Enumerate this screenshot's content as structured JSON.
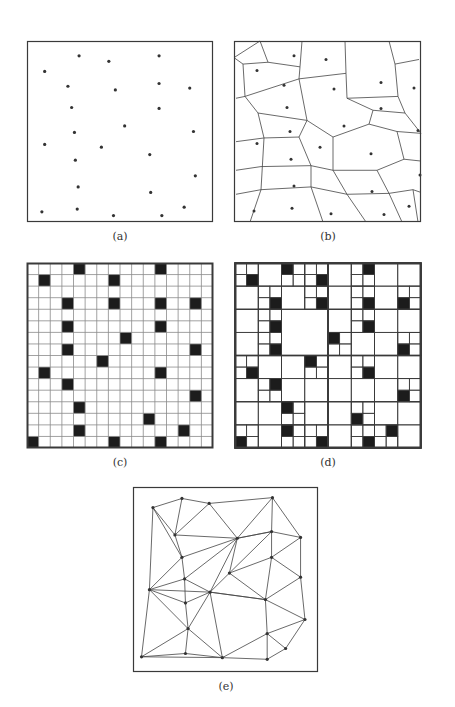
{
  "figure": {
    "colors": {
      "line": "#444444",
      "frame": "#3a3a3a",
      "cell_fill": "#1c1c1c",
      "point": "#333333",
      "grid": "#8a8a8a"
    },
    "panels": [
      {
        "id": "a",
        "caption": "(a)",
        "type": "point-set",
        "frame": [
          27,
          41,
          186,
          181
        ]
      },
      {
        "id": "b",
        "caption": "(b)",
        "type": "voronoi",
        "frame": [
          234,
          41,
          187,
          181
        ]
      },
      {
        "id": "c",
        "caption": "(c)",
        "type": "raster-grid",
        "frame": [
          27,
          263,
          186,
          185
        ],
        "grid_size": 16
      },
      {
        "id": "d",
        "caption": "(d)",
        "type": "quadtree",
        "frame": [
          235,
          263,
          186,
          185
        ],
        "grid_size": 16
      },
      {
        "id": "e",
        "caption": "(e)",
        "type": "delaunay-tin",
        "frame": [
          133,
          487,
          185,
          185
        ]
      }
    ],
    "points_a": [
      [
        56,
        16
      ],
      [
        88,
        22
      ],
      [
        142,
        16
      ],
      [
        19,
        33
      ],
      [
        44,
        49
      ],
      [
        95,
        53
      ],
      [
        142,
        46
      ],
      [
        175,
        51
      ],
      [
        48,
        72
      ],
      [
        142,
        73
      ],
      [
        105,
        92
      ],
      [
        51,
        99
      ],
      [
        179,
        98
      ],
      [
        19,
        112
      ],
      [
        80,
        115
      ],
      [
        52,
        129
      ],
      [
        132,
        123
      ],
      [
        181,
        146
      ],
      [
        55,
        158
      ],
      [
        133,
        164
      ],
      [
        169,
        180
      ],
      [
        16,
        185
      ],
      [
        54,
        182
      ],
      [
        93,
        189
      ],
      [
        145,
        189
      ]
    ],
    "points_b": [
      [
        60,
        16
      ],
      [
        92,
        20
      ],
      [
        147,
        45
      ],
      [
        23,
        32
      ],
      [
        50,
        48
      ],
      [
        100,
        52
      ],
      [
        180,
        51
      ],
      [
        53,
        72
      ],
      [
        147,
        73
      ],
      [
        110,
        92
      ],
      [
        56,
        98
      ],
      [
        184,
        97
      ],
      [
        23,
        111
      ],
      [
        86,
        115
      ],
      [
        57,
        128
      ],
      [
        137,
        122
      ],
      [
        186,
        145
      ],
      [
        60,
        157
      ],
      [
        138,
        163
      ],
      [
        175,
        179
      ],
      [
        20,
        184
      ],
      [
        58,
        181
      ],
      [
        97,
        187
      ],
      [
        150,
        188
      ]
    ],
    "voronoi_edges": [
      [
        0,
        18,
        26,
        0
      ],
      [
        26,
        0,
        34,
        23
      ],
      [
        34,
        23,
        9,
        25
      ],
      [
        9,
        25,
        0,
        18
      ],
      [
        34,
        23,
        66,
        28
      ],
      [
        66,
        28,
        68,
        0
      ],
      [
        66,
        28,
        65,
        41
      ],
      [
        65,
        41,
        11,
        60
      ],
      [
        11,
        60,
        9,
        25
      ],
      [
        11,
        60,
        2,
        62
      ],
      [
        65,
        41,
        112,
        35
      ],
      [
        112,
        35,
        111,
        0
      ],
      [
        112,
        35,
        113,
        62
      ],
      [
        113,
        62,
        164,
        60
      ],
      [
        164,
        60,
        161,
        25
      ],
      [
        161,
        25,
        185,
        20
      ],
      [
        161,
        25,
        155,
        0
      ],
      [
        113,
        62,
        139,
        75
      ],
      [
        139,
        75,
        171,
        78
      ],
      [
        171,
        78,
        164,
        60
      ],
      [
        171,
        78,
        187,
        100
      ],
      [
        139,
        75,
        135,
        90
      ],
      [
        135,
        90,
        99,
        104
      ],
      [
        99,
        104,
        73,
        86
      ],
      [
        73,
        86,
        65,
        41
      ],
      [
        73,
        86,
        24,
        78
      ],
      [
        24,
        78,
        11,
        60
      ],
      [
        24,
        78,
        30,
        105
      ],
      [
        30,
        105,
        2,
        109
      ],
      [
        30,
        105,
        65,
        104
      ],
      [
        65,
        104,
        73,
        86
      ],
      [
        65,
        104,
        77,
        135
      ],
      [
        77,
        135,
        99,
        140
      ],
      [
        99,
        140,
        99,
        104
      ],
      [
        135,
        90,
        163,
        98
      ],
      [
        163,
        98,
        187,
        100
      ],
      [
        163,
        98,
        170,
        128
      ],
      [
        170,
        128,
        187,
        130
      ],
      [
        170,
        128,
        143,
        140
      ],
      [
        143,
        140,
        99,
        140
      ],
      [
        99,
        140,
        113,
        166
      ],
      [
        113,
        166,
        77,
        158
      ],
      [
        77,
        158,
        77,
        135
      ],
      [
        77,
        158,
        27,
        161
      ],
      [
        27,
        161,
        30,
        105
      ],
      [
        27,
        161,
        2,
        166
      ],
      [
        27,
        161,
        16,
        196
      ],
      [
        77,
        158,
        89,
        196
      ],
      [
        113,
        166,
        132,
        196
      ],
      [
        77,
        135,
        27,
        136
      ],
      [
        143,
        140,
        155,
        165
      ],
      [
        155,
        165,
        113,
        166
      ],
      [
        155,
        165,
        168,
        196
      ],
      [
        155,
        165,
        179,
        161
      ],
      [
        179,
        161,
        187,
        164
      ],
      [
        179,
        161,
        184,
        196
      ],
      [
        27,
        136,
        2,
        140
      ]
    ],
    "filled_cells": [
      [
        0,
        4
      ],
      [
        0,
        11
      ],
      [
        1,
        1
      ],
      [
        1,
        7
      ],
      [
        3,
        3
      ],
      [
        3,
        7
      ],
      [
        3,
        11
      ],
      [
        3,
        14
      ],
      [
        5,
        3
      ],
      [
        5,
        11
      ],
      [
        6,
        8
      ],
      [
        7,
        3
      ],
      [
        7,
        14
      ],
      [
        8,
        6
      ],
      [
        9,
        1
      ],
      [
        9,
        11
      ],
      [
        10,
        3
      ],
      [
        11,
        14
      ],
      [
        12,
        4
      ],
      [
        13,
        10
      ],
      [
        14,
        4
      ],
      [
        14,
        13
      ],
      [
        15,
        0
      ],
      [
        15,
        7
      ],
      [
        15,
        11
      ]
    ],
    "tin_nodes": [
      [
        17,
        20
      ],
      [
        50,
        9
      ],
      [
        81,
        15
      ],
      [
        153,
        8
      ],
      [
        42,
        53
      ],
      [
        152,
        49
      ],
      [
        185,
        56
      ],
      [
        113,
        57
      ],
      [
        50,
        80
      ],
      [
        152,
        80
      ],
      [
        104,
        99
      ],
      [
        185,
        104
      ],
      [
        53,
        106
      ],
      [
        13,
        119
      ],
      [
        82,
        122
      ],
      [
        54,
        135
      ],
      [
        145,
        131
      ],
      [
        190,
        155
      ],
      [
        57,
        166
      ],
      [
        147,
        172
      ],
      [
        4,
        200
      ],
      [
        54,
        196
      ],
      [
        96,
        201
      ],
      [
        168,
        190
      ],
      [
        147,
        203
      ]
    ],
    "tin_edges": [
      [
        0,
        1
      ],
      [
        1,
        2
      ],
      [
        2,
        3
      ],
      [
        0,
        4
      ],
      [
        1,
        4
      ],
      [
        4,
        2
      ],
      [
        2,
        7
      ],
      [
        4,
        7
      ],
      [
        3,
        7
      ],
      [
        3,
        5
      ],
      [
        3,
        6
      ],
      [
        5,
        6
      ],
      [
        7,
        5
      ],
      [
        0,
        13
      ],
      [
        0,
        8
      ],
      [
        4,
        8
      ],
      [
        8,
        7
      ],
      [
        8,
        13
      ],
      [
        8,
        12
      ],
      [
        12,
        7
      ],
      [
        7,
        14
      ],
      [
        7,
        10
      ],
      [
        10,
        5
      ],
      [
        5,
        9
      ],
      [
        9,
        6
      ],
      [
        6,
        11
      ],
      [
        9,
        11
      ],
      [
        9,
        10
      ],
      [
        10,
        14
      ],
      [
        12,
        14
      ],
      [
        13,
        12
      ],
      [
        13,
        14
      ],
      [
        13,
        15
      ],
      [
        12,
        15
      ],
      [
        14,
        15
      ],
      [
        14,
        16
      ],
      [
        10,
        16
      ],
      [
        16,
        9
      ],
      [
        16,
        11
      ],
      [
        11,
        17
      ],
      [
        16,
        17
      ],
      [
        13,
        18
      ],
      [
        15,
        18
      ],
      [
        14,
        18
      ],
      [
        14,
        22
      ],
      [
        18,
        22
      ],
      [
        14,
        16
      ],
      [
        16,
        19
      ],
      [
        17,
        19
      ],
      [
        19,
        22
      ],
      [
        19,
        24
      ],
      [
        19,
        23
      ],
      [
        17,
        23
      ],
      [
        23,
        24
      ],
      [
        13,
        20
      ],
      [
        20,
        18
      ],
      [
        20,
        21
      ],
      [
        21,
        18
      ],
      [
        21,
        22
      ],
      [
        20,
        22
      ],
      [
        22,
        24
      ],
      [
        5,
        7
      ]
    ]
  }
}
